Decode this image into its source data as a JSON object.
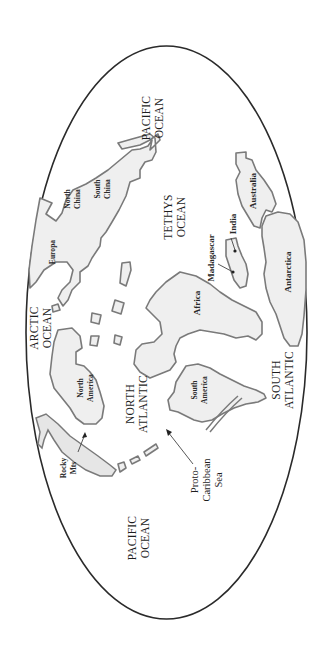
{
  "map": {
    "projection": "ellipse",
    "orientation": "rotated-90-ccw",
    "colors": {
      "outline": "#2a2a2a",
      "land_fill": "#efefef",
      "land_stroke": "#7a7a7a",
      "ocean": "#ffffff"
    },
    "oceans": {
      "pacific_top": [
        "PACIFIC",
        "OCEAN"
      ],
      "tethys": [
        "TETHYS",
        "OCEAN"
      ],
      "arctic": [
        "ARCTIC",
        "OCEAN"
      ],
      "north_atlantic": [
        "NORTH",
        "ATLANTIC"
      ],
      "south_atlantic": [
        "SOUTH",
        "ATLANTIC"
      ],
      "pacific_bottom": [
        "PACIFIC",
        "OCEAN"
      ]
    },
    "landmasses": {
      "north_china": [
        "North",
        "China"
      ],
      "south_china": [
        "South",
        "China"
      ],
      "europa": "Europa",
      "north_america": [
        "North",
        "America"
      ],
      "south_america": [
        "South",
        "America"
      ],
      "africa": "Africa",
      "madagascar": "Madagascar",
      "india": "India",
      "australia": "Australia",
      "antarctica": "Antarctica"
    },
    "features": {
      "rocky_mts": [
        "Rocky",
        "Mts"
      ],
      "proto_caribbean": [
        "Proto-",
        "Caribbean",
        "Sea"
      ]
    }
  }
}
